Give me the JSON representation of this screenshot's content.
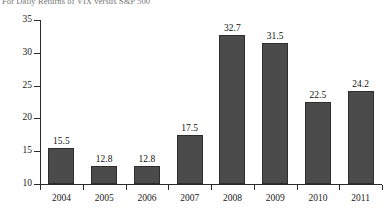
{
  "chart_data": {
    "type": "bar",
    "title": "For Daily Returns of VIX versus S&P 500",
    "xlabel": "",
    "ylabel": "",
    "categories": [
      "2004",
      "2005",
      "2006",
      "2007",
      "2008",
      "2009",
      "2010",
      "2011"
    ],
    "values": [
      15.5,
      12.8,
      12.8,
      17.5,
      32.7,
      31.5,
      22.5,
      24.2
    ],
    "value_labels": [
      "15.5",
      "12.8",
      "12.8",
      "17.5",
      "32.7",
      "31.5",
      "22.5",
      "24.2"
    ],
    "ylim": [
      10,
      35
    ],
    "yticks": [
      10,
      15,
      20,
      25,
      30,
      35
    ],
    "ytick_labels": [
      "10",
      "15",
      "20",
      "25",
      "30",
      "35"
    ],
    "grid": false,
    "legend": false,
    "bar_color": "#4b4b4b",
    "bar_edge_color": "#2e2e2e",
    "axis_color": "#2b2b2b",
    "background": "#ffffff"
  }
}
